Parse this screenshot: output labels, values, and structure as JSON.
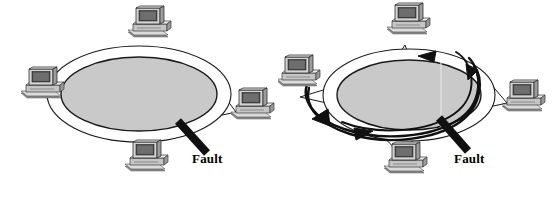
{
  "figure": {
    "background_color": "#ffffff",
    "width": 556,
    "height": 200
  },
  "colors": {
    "ring_fill": "#c9c9c9",
    "ring_outline": "#1a1a1a",
    "band_fill": "#ffffff",
    "fault_bar": "#101010",
    "arrow": "#101010",
    "link_line": "#1a1a1a",
    "monitor_body": "#d8d8d8",
    "monitor_screen": "#4a4a4a",
    "monitor_shadow": "#8d8d8d",
    "case_top": "#e2e2e2",
    "case_side": "#9a9a9a",
    "text": "#000000"
  },
  "panels": [
    {
      "id": "left",
      "name": "ring-with-fault",
      "fault_label": "Fault",
      "has_wrap_arrows": false,
      "nodes": [
        {
          "id": "top",
          "label": "workstation-top",
          "x": 150,
          "y": 28
        },
        {
          "id": "left",
          "label": "workstation-left",
          "x": 42,
          "y": 88
        },
        {
          "id": "right",
          "label": "workstation-right",
          "x": 249,
          "y": 108
        },
        {
          "id": "bottom",
          "label": "workstation-bottom",
          "x": 144,
          "y": 160
        }
      ],
      "ring": {
        "cx": 139,
        "cy": 94,
        "outer_rx": 92,
        "outer_ry": 48,
        "inner_rx": 78,
        "inner_ry": 37
      },
      "fault": {
        "x1": 178,
        "y1": 122,
        "x2": 207,
        "y2": 153,
        "width": 8
      }
    },
    {
      "id": "right",
      "name": "ring-with-wraparound-recovery",
      "fault_label": "Fault",
      "has_wrap_arrows": true,
      "nodes": [
        {
          "id": "top",
          "label": "workstation-top",
          "x": 409,
          "y": 25
        },
        {
          "id": "left",
          "label": "workstation-left",
          "x": 302,
          "y": 75
        },
        {
          "id": "right",
          "label": "workstation-right",
          "x": 513,
          "y": 100
        },
        {
          "id": "bottom",
          "label": "workstation-bottom",
          "x": 404,
          "y": 162
        }
      ],
      "ring": {
        "cx": 409,
        "cy": 95,
        "outer_rx": 86,
        "outer_ry": 46,
        "inner_rx": 72,
        "inner_ry": 35
      },
      "fault": {
        "x1": 440,
        "y1": 119,
        "x2": 468,
        "y2": 151,
        "width": 8
      },
      "arrows": [
        {
          "id": "top-inner-left",
          "label": "wrap-arrow-top",
          "direction": "left"
        },
        {
          "id": "right-down",
          "label": "wrap-arrow-right",
          "direction": "down"
        },
        {
          "id": "lower-left-up",
          "label": "wrap-arrow-lower-left",
          "direction": "up-right"
        },
        {
          "id": "bottom-right",
          "label": "wrap-arrow-bottom",
          "direction": "right"
        }
      ]
    }
  ]
}
